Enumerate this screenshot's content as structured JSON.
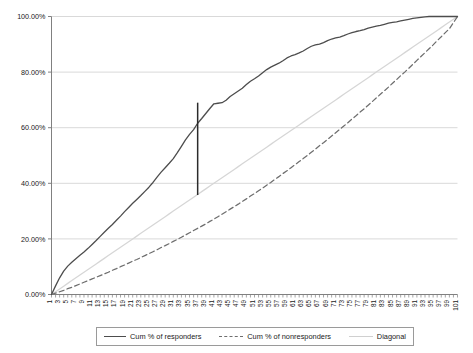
{
  "chart_data": {
    "type": "line",
    "title": "",
    "xlabel": "",
    "ylabel": "",
    "ylim": [
      0,
      100
    ],
    "xlim": [
      1,
      101
    ],
    "grid": "horizontal",
    "legend_position": "bottom",
    "ytick_labels": [
      "0.00%",
      "20.00%",
      "40.00%",
      "60.00%",
      "80.00%",
      "100.00%"
    ],
    "ytick_values": [
      0,
      20,
      40,
      60,
      80,
      100
    ],
    "xtick_labels": [
      "1",
      "3",
      "5",
      "7",
      "9",
      "11",
      "13",
      "15",
      "17",
      "19",
      "21",
      "23",
      "25",
      "27",
      "29",
      "31",
      "33",
      "35",
      "37",
      "39",
      "41",
      "43",
      "45",
      "47",
      "49",
      "51",
      "53",
      "55",
      "57",
      "59",
      "61",
      "63",
      "65",
      "67",
      "69",
      "71",
      "73",
      "75",
      "77",
      "79",
      "81",
      "83",
      "85",
      "87",
      "89",
      "91",
      "93",
      "95",
      "97",
      "99",
      "101"
    ],
    "x": [
      1,
      2,
      3,
      4,
      5,
      6,
      7,
      8,
      9,
      10,
      11,
      12,
      13,
      14,
      15,
      16,
      17,
      18,
      19,
      20,
      21,
      22,
      23,
      24,
      25,
      26,
      27,
      28,
      29,
      30,
      31,
      32,
      33,
      34,
      35,
      36,
      37,
      38,
      39,
      40,
      41,
      42,
      43,
      44,
      45,
      46,
      47,
      48,
      49,
      50,
      51,
      52,
      53,
      54,
      55,
      56,
      57,
      58,
      59,
      60,
      61,
      62,
      63,
      64,
      65,
      66,
      67,
      68,
      69,
      70,
      71,
      72,
      73,
      74,
      75,
      76,
      77,
      78,
      79,
      80,
      81,
      82,
      83,
      84,
      85,
      86,
      87,
      88,
      89,
      90,
      91,
      92,
      93,
      94,
      95,
      96,
      97,
      98,
      99,
      100,
      101
    ],
    "series": [
      {
        "name": "Cum % of responders",
        "style": "solid",
        "color": "#4d4d4d",
        "values": [
          0.0,
          3.1,
          6.0,
          8.4,
          10.2,
          11.6,
          12.9,
          14.1,
          15.3,
          16.6,
          18.0,
          19.4,
          20.9,
          22.4,
          23.8,
          25.2,
          26.7,
          28.2,
          29.8,
          31.3,
          32.8,
          34.2,
          35.6,
          37.1,
          38.6,
          40.3,
          42.2,
          44.0,
          45.6,
          47.2,
          48.9,
          51.0,
          53.3,
          55.6,
          57.6,
          59.3,
          61.6,
          63.3,
          65.1,
          66.9,
          68.6,
          68.8,
          69.0,
          69.9,
          71.2,
          72.2,
          73.2,
          74.2,
          75.5,
          76.7,
          77.6,
          78.6,
          79.8,
          80.9,
          81.8,
          82.5,
          83.2,
          84.1,
          85.1,
          85.8,
          86.3,
          86.9,
          87.6,
          88.5,
          89.3,
          89.8,
          90.1,
          90.6,
          91.3,
          91.9,
          92.3,
          92.6,
          93.1,
          93.7,
          94.2,
          94.6,
          94.9,
          95.3,
          95.8,
          96.2,
          96.5,
          96.8,
          97.2,
          97.6,
          97.9,
          98.1,
          98.4,
          98.7,
          99.0,
          99.3,
          99.5,
          99.7,
          99.9,
          100.0,
          100.0,
          100.0,
          100.0,
          100.0,
          100.0,
          100.0,
          100.0
        ]
      },
      {
        "name": "Cum % of nonresponders",
        "style": "dashed",
        "color": "#6e6e6e",
        "values": [
          0.0,
          0.5,
          1.0,
          1.5,
          2.1,
          2.6,
          3.2,
          3.8,
          4.4,
          5.0,
          5.6,
          6.2,
          6.8,
          7.4,
          8.0,
          8.7,
          9.3,
          10.0,
          10.6,
          11.3,
          12.0,
          12.6,
          13.3,
          14.0,
          14.7,
          15.4,
          16.1,
          16.9,
          17.6,
          18.3,
          19.1,
          19.8,
          20.6,
          21.4,
          22.2,
          23.0,
          23.8,
          24.6,
          25.4,
          26.3,
          27.1,
          28.0,
          28.9,
          29.8,
          30.7,
          31.6,
          32.5,
          33.5,
          34.4,
          35.4,
          36.3,
          37.3,
          38.3,
          39.3,
          40.3,
          41.4,
          42.4,
          43.5,
          44.5,
          45.6,
          46.7,
          47.8,
          48.9,
          50.0,
          51.2,
          52.3,
          53.5,
          54.6,
          55.8,
          57.0,
          58.2,
          59.4,
          60.6,
          61.8,
          63.1,
          64.3,
          65.6,
          66.8,
          68.1,
          69.4,
          70.7,
          72.0,
          73.3,
          74.6,
          76.0,
          77.3,
          78.7,
          80.0,
          81.4,
          82.8,
          84.2,
          85.6,
          87.0,
          88.4,
          89.8,
          91.3,
          92.7,
          94.2,
          95.6,
          97.8,
          100.0
        ]
      },
      {
        "name": "Diagonal",
        "style": "solid",
        "color": "#d6d6d6",
        "values": [
          0,
          1,
          2,
          3,
          4,
          5,
          6,
          7,
          8,
          9,
          10,
          11,
          12,
          13,
          14,
          15,
          16,
          17,
          18,
          19,
          20,
          21,
          22,
          23,
          24,
          25,
          26,
          27,
          28,
          29,
          30,
          31,
          32,
          33,
          34,
          35,
          36,
          37,
          38,
          39,
          40,
          41,
          42,
          43,
          44,
          45,
          46,
          47,
          48,
          49,
          50,
          51,
          52,
          53,
          54,
          55,
          56,
          57,
          58,
          59,
          60,
          61,
          62,
          63,
          64,
          65,
          66,
          67,
          68,
          69,
          70,
          71,
          72,
          73,
          74,
          75,
          76,
          77,
          78,
          79,
          80,
          81,
          82,
          83,
          84,
          85,
          86,
          87,
          88,
          89,
          90,
          91,
          92,
          93,
          94,
          95,
          96,
          97,
          98,
          99,
          100
        ]
      }
    ],
    "annotations": [
      {
        "name": "ks-vertical-line",
        "type": "vertical-segment",
        "x": 37,
        "y_top": 69.0,
        "y_bottom": 35.8,
        "color": "#2b2b2b"
      }
    ]
  },
  "legend": {
    "items": [
      {
        "label": "Cum % of responders",
        "style": "solid",
        "color": "#4d4d4d"
      },
      {
        "label": "Cum % of nonresponders",
        "style": "dashed",
        "color": "#6e6e6e"
      },
      {
        "label": "Diagonal",
        "style": "solid",
        "color": "#d6d6d6"
      }
    ]
  },
  "colors": {
    "grid": "#d9d9d9",
    "axis": "#808080",
    "background": "#ffffff"
  }
}
